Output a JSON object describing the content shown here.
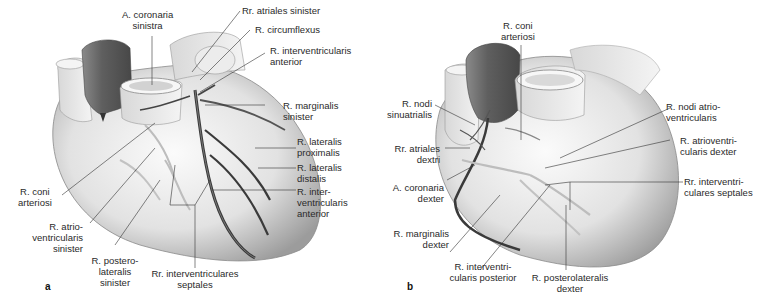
{
  "figure": {
    "panels": [
      {
        "id": "a",
        "letter": "a",
        "view": "anterior view, left coronary artery",
        "labels": [
          {
            "key": "a_coronaria_sinistra",
            "lines": [
              "A. coronaria",
              "sinistra"
            ]
          },
          {
            "key": "rr_atriales_sinister",
            "lines": [
              "Rr. atriales sinister"
            ]
          },
          {
            "key": "r_circumflexus",
            "lines": [
              "R. circumflexus"
            ]
          },
          {
            "key": "r_interventricularis_anterior_top",
            "lines": [
              "R. interventricularis",
              "anterior"
            ]
          },
          {
            "key": "r_marginalis_sinister",
            "lines": [
              "R. marginalis",
              "sinister"
            ]
          },
          {
            "key": "r_lateralis_proximalis",
            "lines": [
              "R. lateralis",
              "proximalis"
            ]
          },
          {
            "key": "r_lateralis_distalis",
            "lines": [
              "R. lateralis",
              "distalis"
            ]
          },
          {
            "key": "r_interventricularis_anterior",
            "lines": [
              "R. inter-",
              "ventricularis",
              "anterior"
            ]
          },
          {
            "key": "r_coni_arteriosi",
            "lines": [
              "R. coni",
              "arteriosi"
            ]
          },
          {
            "key": "r_atrioventricularis_sinister",
            "lines": [
              "R. atrio-",
              "ventricularis",
              "sinister"
            ]
          },
          {
            "key": "r_posterolateralis_sinister",
            "lines": [
              "R. postero-",
              "lateralis",
              "sinister"
            ]
          },
          {
            "key": "rr_interventriculares_septales",
            "lines": [
              "Rr. interventriculares",
              "septales"
            ]
          }
        ]
      },
      {
        "id": "b",
        "letter": "b",
        "view": "anterior view, right coronary artery",
        "labels": [
          {
            "key": "r_coni_arteriosi",
            "lines": [
              "R. coni",
              "arteriosi"
            ]
          },
          {
            "key": "r_nodi_sinuatrialis",
            "lines": [
              "R. nodi",
              "sinuatrialis"
            ]
          },
          {
            "key": "rr_atriales_dextri",
            "lines": [
              "Rr. atriales",
              "dextri"
            ]
          },
          {
            "key": "a_coronaria_dexter",
            "lines": [
              "A. coronaria",
              "dexter"
            ]
          },
          {
            "key": "r_nodi_atrioventricularis",
            "lines": [
              "R. nodi atrio-",
              "ventricularis"
            ]
          },
          {
            "key": "r_atrioventricularis_dexter",
            "lines": [
              "R. atrioventri-",
              "cularis dexter"
            ]
          },
          {
            "key": "rr_interventriculares_septales",
            "lines": [
              "Rr. interventri-",
              "culares septales"
            ]
          },
          {
            "key": "r_marginalis_dexter",
            "lines": [
              "R. marginalis",
              "dexter"
            ]
          },
          {
            "key": "r_interventricularis_posterior",
            "lines": [
              "R. interventri-",
              "cularis posterior"
            ]
          },
          {
            "key": "r_posterolateralis_dexter",
            "lines": [
              "R. posterolateralis",
              "dexter"
            ]
          }
        ]
      }
    ],
    "colors": {
      "heart_surface": "#e6e6e6",
      "heart_shadow": "#9a9a9a",
      "atrium": "#6e6e6e",
      "artery_dark": "#3a3a3a",
      "artery_light": "#b5b5b5",
      "leader_line": "#333333"
    }
  }
}
